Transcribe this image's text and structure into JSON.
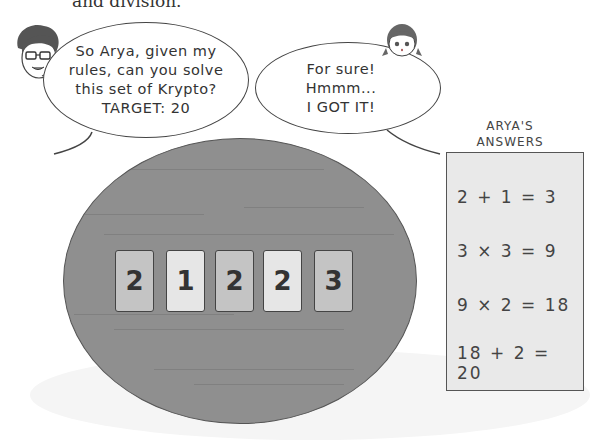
{
  "top_text": "and division.",
  "speech": {
    "teacher": {
      "lines": [
        "So Arya, given my",
        "rules, can you solve",
        "this set of Krypto?",
        "TARGET: 20"
      ]
    },
    "arya": {
      "lines": [
        "For sure!",
        "Hmmm...",
        "I GOT IT!"
      ]
    }
  },
  "cards": [
    {
      "value": "2",
      "color": "#c4c4c4"
    },
    {
      "value": "1",
      "color": "#e6e6e6"
    },
    {
      "value": "2",
      "color": "#c4c4c4"
    },
    {
      "value": "2",
      "color": "#e6e6e6"
    },
    {
      "value": "3",
      "color": "#c4c4c4"
    }
  ],
  "answers": {
    "title_line1": "ARYA'S",
    "title_line2": "ANSWERS",
    "steps": [
      "2 + 1 = 3",
      "3 × 3 = 9",
      "9 × 2 = 18",
      "18 + 2 = 20"
    ]
  },
  "colors": {
    "table": "#8f8f8f",
    "answers_box": "#e9e9e9"
  }
}
